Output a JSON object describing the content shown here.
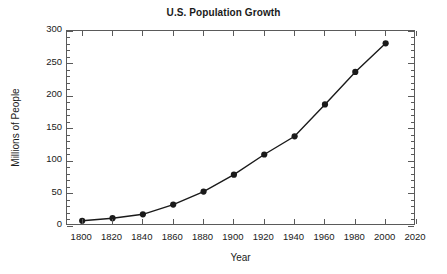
{
  "chart_data": {
    "type": "line",
    "title": "U.S. Population Growth",
    "xlabel": "Year",
    "ylabel": "Millions of People",
    "x": [
      1800,
      1820,
      1840,
      1860,
      1880,
      1900,
      1920,
      1940,
      1960,
      1980,
      2000
    ],
    "values": [
      8,
      12,
      18,
      33,
      53,
      79,
      110,
      138,
      187,
      237,
      281
    ],
    "series": [
      {
        "name": "U.S. Population",
        "values": [
          8,
          12,
          18,
          33,
          53,
          79,
          110,
          138,
          187,
          237,
          281
        ]
      }
    ],
    "xlim": [
      1790,
      2020
    ],
    "ylim": [
      0,
      300
    ],
    "x_ticks": [
      1800,
      1820,
      1840,
      1860,
      1880,
      1900,
      1920,
      1940,
      1960,
      1980,
      2000,
      2020
    ],
    "x_tick_labels": [
      "1800",
      "1820",
      "1840",
      "1860",
      "1880",
      "1900",
      "1920",
      "1940",
      "1960",
      "1980",
      "2000",
      "2020"
    ],
    "y_ticks": [
      0,
      50,
      100,
      150,
      200,
      250,
      300
    ],
    "y_tick_labels": [
      "0",
      "50",
      "100",
      "150",
      "200",
      "250",
      "300"
    ],
    "y_minor_step": 10,
    "grid": false,
    "legend": null,
    "marker": "circle",
    "line_color": "#1a1a1a",
    "marker_color": "#1a1a1a",
    "axis_color": "#5a5a5a",
    "background_color": "#ffffff"
  }
}
